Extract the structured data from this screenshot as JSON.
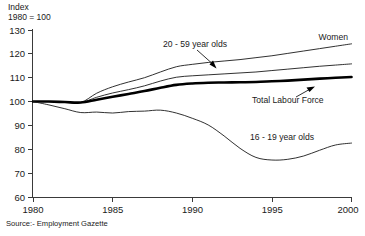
{
  "chart_data": {
    "type": "line",
    "title": "",
    "xlabel": "",
    "ylabel": "Index 1980 = 100",
    "ylabel_line1": "Index",
    "ylabel_line2": "1980 = 100",
    "xlim": [
      1980,
      2000
    ],
    "ylim": [
      60,
      130
    ],
    "grid": false,
    "legend_position": "inline-annotations",
    "x_ticks": [
      1980,
      1985,
      1990,
      1995,
      2000
    ],
    "x_tick_labels": [
      "1980",
      "1985",
      "1990",
      "1995",
      "2000"
    ],
    "y_ticks": [
      60,
      70,
      80,
      90,
      100,
      110,
      120,
      130
    ],
    "y_tick_labels": [
      "60",
      "70",
      "80",
      "90",
      "100",
      "110",
      "120",
      "130"
    ],
    "x": [
      1980,
      1981,
      1982,
      1983,
      1984,
      1985,
      1986,
      1987,
      1988,
      1989,
      1990,
      1991,
      1992,
      1993,
      1994,
      1995,
      1996,
      1997,
      1998,
      1999,
      2000
    ],
    "series": [
      {
        "name": "Women",
        "emphasis": false,
        "values": [
          100,
          100,
          99.8,
          99.6,
          103.5,
          106.2,
          108.2,
          110.0,
          112.4,
          114.6,
          115.6,
          116.4,
          117.0,
          117.6,
          118.4,
          119.2,
          120.2,
          121.2,
          122.2,
          123.2,
          124.2
        ]
      },
      {
        "name": "20 - 59 year olds",
        "emphasis": false,
        "values": [
          100,
          100,
          99.8,
          99.6,
          101.8,
          103.6,
          105.0,
          106.6,
          108.6,
          110.2,
          110.8,
          111.2,
          111.6,
          112.0,
          112.4,
          113.0,
          113.6,
          114.2,
          114.8,
          115.3,
          115.8
        ]
      },
      {
        "name": "Total Labour Force",
        "emphasis": true,
        "values": [
          100,
          100,
          99.8,
          99.6,
          100.8,
          102.0,
          103.2,
          104.4,
          105.8,
          107.0,
          107.6,
          107.9,
          108.0,
          108.1,
          108.2,
          108.5,
          108.8,
          109.2,
          109.6,
          110.0,
          110.3
        ]
      },
      {
        "name": "16 - 19 year olds",
        "emphasis": false,
        "values": [
          100,
          98.6,
          97.0,
          95.4,
          95.6,
          95.2,
          95.8,
          96.0,
          96.4,
          95.2,
          93.0,
          90.2,
          85.6,
          80.4,
          76.6,
          75.5,
          75.8,
          77.2,
          79.6,
          81.8,
          82.6
        ]
      }
    ],
    "annotations": [
      {
        "text": "Women",
        "has_arrow": false
      },
      {
        "text": "20 - 59 year olds",
        "has_arrow": true
      },
      {
        "text": "Total Labour Force",
        "has_arrow": true
      },
      {
        "text": "16 - 19 year olds",
        "has_arrow": false
      }
    ],
    "source": "Source:- Employment Gazette"
  }
}
